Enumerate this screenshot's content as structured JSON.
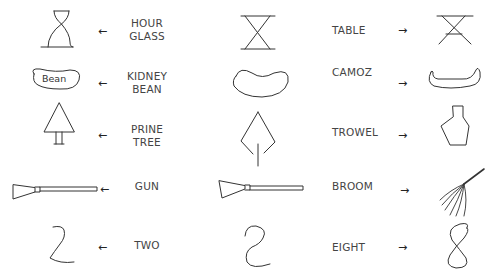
{
  "rows": [
    {
      "left_drawing": "hour-glass",
      "left_label": [
        "HOUR",
        "GLASS"
      ],
      "left_arrow": "←",
      "center_drawing": "table-hourglass-shape",
      "right_label": "TABLE",
      "right_arrow": "→",
      "right_drawing": "table"
    },
    {
      "left_drawing": "kidney-bean",
      "left_inner_text": "Bean",
      "left_label": [
        "KIDNEY",
        "BEAN"
      ],
      "left_arrow": "←",
      "center_drawing": "kidney-shape",
      "right_label": "CAMOZ",
      "right_arrow": "→",
      "right_drawing": "canoe"
    },
    {
      "left_drawing": "pine-tree",
      "left_label": [
        "PRINE",
        "TREE"
      ],
      "left_arrow": "←",
      "center_drawing": "trowel-shape",
      "right_label": "TROWEL",
      "right_arrow": "→",
      "right_drawing": "bottle"
    },
    {
      "left_drawing": "gun",
      "left_label": [
        "GUN"
      ],
      "left_arrow": "←",
      "center_drawing": "gun-broom-shape",
      "right_label": "BROOM",
      "right_arrow": "→",
      "right_drawing": "broom"
    },
    {
      "left_drawing": "two",
      "left_label": [
        "TWO"
      ],
      "left_arrow": "←",
      "center_drawing": "s-curve-shape",
      "right_label": "EIGHT",
      "right_arrow": "→",
      "right_drawing": "eight"
    }
  ],
  "colors": {
    "stroke": "#333333",
    "text": "#444444",
    "background": "#ffffff"
  }
}
